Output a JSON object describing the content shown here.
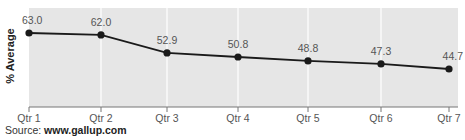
{
  "chart_data": {
    "type": "line",
    "title": "",
    "xlabel": "",
    "ylabel": "% Average",
    "categories": [
      "Qtr 1",
      "Qtr 2",
      "Qtr 3",
      "Qtr 4",
      "Qtr 5",
      "Qtr 6",
      "Qtr 7"
    ],
    "series": [
      {
        "name": "% Average",
        "values": [
          63.0,
          62.0,
          52.9,
          50.8,
          48.8,
          47.3,
          44.7
        ],
        "labels": [
          "63.0",
          "62.0",
          "52.9",
          "50.8",
          "48.8",
          "47.3",
          "44.7"
        ]
      }
    ],
    "ylim": [
      25.4,
      67
    ],
    "grid": "vertical",
    "legend": "none",
    "colors": {
      "plot_background": "#e6e6e6",
      "gridline": "#ffffff",
      "line": "#1a1a1a",
      "axis": "#777777"
    }
  },
  "source": {
    "prefix": "Source: ",
    "url": "www.gallup.com"
  }
}
